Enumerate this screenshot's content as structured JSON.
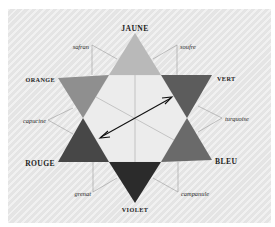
{
  "diagram": {
    "type": "chromatic-star",
    "primary_and_secondary_labels": {
      "top": "JAUNE",
      "upper_right": "VERT",
      "lower_right": "BLEU",
      "bottom": "VIOLET",
      "lower_left": "ROUGE",
      "upper_left": "ORANGE"
    },
    "intermediate_labels": {
      "top_left": "safran",
      "top_right": "soufre",
      "right": "turquoise",
      "bottom_right": "campanule",
      "bottom_left": "grenat",
      "left": "capucine"
    },
    "colors": {
      "background": "#e9e9e9",
      "jaune": "#b9b9b9",
      "orange": "#8f8f8f",
      "vert": "#5c5c5c",
      "rouge": "#474747",
      "bleu": "#6a6a6a",
      "violet": "#2b2b2b",
      "hexagon": "#ececec",
      "leader_lines": "#9a9a9a",
      "arrow": "#111111"
    },
    "arrow": {
      "from": "rouge",
      "to": "vert",
      "style": "double-headed"
    }
  }
}
